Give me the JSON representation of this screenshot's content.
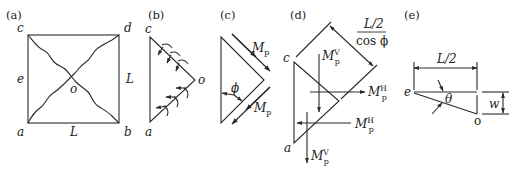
{
  "figure": {
    "panels": [
      {
        "id": "a",
        "label": "(a)",
        "description": "Square plate with wavy yield-line diagonals",
        "vertex_labels": {
          "c": "c",
          "d": "d",
          "a": "a",
          "b": "b",
          "e": "e",
          "o": "o"
        },
        "dimension_labels": {
          "bottom": "L",
          "right": "L"
        }
      },
      {
        "id": "b",
        "label": "(b)",
        "description": "Triangular segment a-c-o with moment arrows along edges",
        "vertex_labels": {
          "c": "c",
          "a": "a",
          "o": "o"
        }
      },
      {
        "id": "c",
        "label": "(c)",
        "description": "Triangular segment with plastic moments along yield lines",
        "moment_labels": {
          "top": "M",
          "top_sub": "p",
          "bottom": "M",
          "bottom_sub": "p"
        },
        "angle_label": "ϕ"
      },
      {
        "id": "d",
        "label": "(d)",
        "description": "Moment components decomposition",
        "vertex_labels": {
          "c": "c",
          "a": "a"
        },
        "length_label": {
          "numerator": "L/2",
          "denominator": "cos ϕ"
        },
        "moment_labels": {
          "vertical_top": {
            "main": "M",
            "sub": "p",
            "sup": "V"
          },
          "horizontal_right": {
            "main": "M",
            "sub": "p",
            "sup": "H"
          },
          "horizontal_left": {
            "main": "M",
            "sub": "p",
            "sup": "H"
          },
          "vertical_bottom": {
            "main": "M",
            "sub": "p",
            "sup": "V"
          }
        }
      },
      {
        "id": "e",
        "label": "(e)",
        "description": "Rotation of segment e-o",
        "vertex_labels": {
          "e": "e",
          "o": "o"
        },
        "dimension_labels": {
          "span": "L/2",
          "deflection": "w"
        },
        "angle_label": "θ"
      }
    ]
  }
}
